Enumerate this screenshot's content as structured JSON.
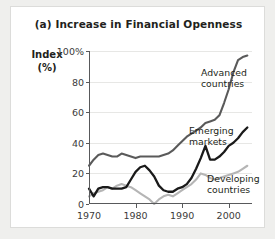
{
  "figure": {
    "title": "(a) Increase in Financial Openness",
    "y_axis_label_line1": "Index",
    "y_axis_label_line2": "(%)"
  },
  "chart_data": {
    "type": "line",
    "title": "(a) Increase in Financial Openness",
    "xlabel": "",
    "ylabel": "Index (%)",
    "xlim": [
      1970,
      2005
    ],
    "ylim": [
      0,
      100
    ],
    "xticks": [
      1970,
      1980,
      1990,
      2000
    ],
    "xtick_labels": [
      "1970",
      "1980",
      "1990",
      "2000"
    ],
    "yticks": [
      0,
      20,
      40,
      60,
      80,
      100
    ],
    "ytick_labels": [
      "0",
      "20",
      "40",
      "60",
      "80",
      "100%"
    ],
    "grid": "horizontal",
    "legend_position": "inline-annotations",
    "series": [
      {
        "name": "Advanced countries",
        "color": "#5a5a5a",
        "label_line1": "Advanced",
        "label_line2": "countries",
        "x": [
          1970,
          1971,
          1972,
          1973,
          1974,
          1975,
          1976,
          1977,
          1978,
          1979,
          1980,
          1981,
          1982,
          1983,
          1984,
          1985,
          1986,
          1987,
          1988,
          1989,
          1990,
          1991,
          1992,
          1993,
          1994,
          1995,
          1996,
          1997,
          1998,
          1999,
          2000,
          2001,
          2002,
          2003,
          2004
        ],
        "values": [
          25,
          29,
          32,
          33,
          32,
          31,
          31,
          33,
          32,
          31,
          30,
          31,
          31,
          31,
          31,
          31,
          32,
          33,
          35,
          38,
          41,
          44,
          46,
          48,
          50,
          53,
          54,
          55,
          58,
          66,
          75,
          86,
          94,
          96,
          97
        ]
      },
      {
        "name": "Emerging markets",
        "color": "#1a1a1a",
        "label_line1": "Emerging",
        "label_line2": "markets",
        "x": [
          1970,
          1971,
          1972,
          1973,
          1974,
          1975,
          1976,
          1977,
          1978,
          1979,
          1980,
          1981,
          1982,
          1983,
          1984,
          1985,
          1986,
          1987,
          1988,
          1989,
          1990,
          1991,
          1992,
          1993,
          1994,
          1995,
          1996,
          1997,
          1998,
          1999,
          2000,
          2001,
          2002,
          2003,
          2004
        ],
        "values": [
          10,
          5,
          10,
          11,
          11,
          10,
          10,
          10,
          11,
          16,
          21,
          24,
          25,
          22,
          18,
          12,
          9,
          8,
          8,
          10,
          11,
          13,
          17,
          23,
          30,
          38,
          29,
          29,
          31,
          34,
          38,
          40,
          43,
          47,
          50
        ]
      },
      {
        "name": "Developing countries",
        "color": "#b5b5b5",
        "label_line1": "Developing",
        "label_line2": "countries",
        "x": [
          1970,
          1971,
          1972,
          1973,
          1974,
          1975,
          1976,
          1977,
          1978,
          1979,
          1980,
          1981,
          1982,
          1983,
          1984,
          1985,
          1986,
          1987,
          1988,
          1989,
          1990,
          1991,
          1992,
          1993,
          1994,
          1995,
          1996,
          1997,
          1998,
          1999,
          2000,
          2001,
          2002,
          2003,
          2004
        ],
        "values": [
          5,
          7,
          8,
          9,
          11,
          10,
          12,
          13,
          12,
          11,
          9,
          7,
          5,
          3,
          0,
          3,
          5,
          6,
          5,
          7,
          9,
          11,
          13,
          16,
          20,
          19,
          17,
          16,
          17,
          18,
          19,
          20,
          21,
          23,
          25
        ]
      }
    ],
    "peak_annotations": [
      {
        "series": "Advanced countries",
        "year": 2002,
        "value": 100,
        "note": "reaches 100% near 2002 then eases to ~96"
      }
    ]
  },
  "axis_ticks": {
    "y": [
      {
        "value": 100,
        "label": "100%"
      },
      {
        "value": 80,
        "label": "80"
      },
      {
        "value": 60,
        "label": "60"
      },
      {
        "value": 40,
        "label": "40"
      },
      {
        "value": 20,
        "label": "20"
      },
      {
        "value": 0,
        "label": "0"
      }
    ],
    "x": [
      {
        "value": 1970,
        "label": "1970"
      },
      {
        "value": 1980,
        "label": "1980"
      },
      {
        "value": 1990,
        "label": "1990"
      },
      {
        "value": 2000,
        "label": "2000"
      }
    ]
  }
}
